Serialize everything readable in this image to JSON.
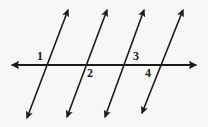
{
  "figure": {
    "background_color": "#f7f7f5",
    "stroke_color": "#1b1b1b",
    "canvas": {
      "width": 208,
      "height": 127
    }
  },
  "transversal": {
    "name": "horizontal-line",
    "type": "double-headed-arrow",
    "x1": 12,
    "y1": 65,
    "x2": 196,
    "y2": 65,
    "stroke_width": 1.8
  },
  "parallel_lines": [
    {
      "id": "line-1",
      "x1": 27,
      "y1": 118,
      "x2": 68,
      "y2": 10,
      "stroke_width": 1.6,
      "arrows": "both"
    },
    {
      "id": "line-2",
      "x1": 67,
      "y1": 117,
      "x2": 107,
      "y2": 10,
      "stroke_width": 1.6,
      "arrows": "both"
    },
    {
      "id": "line-3",
      "x1": 105,
      "y1": 117,
      "x2": 144,
      "y2": 10,
      "stroke_width": 1.6,
      "arrows": "both"
    },
    {
      "id": "line-4",
      "x1": 142,
      "y1": 113,
      "x2": 183,
      "y2": 10,
      "stroke_width": 1.6,
      "arrows": "both"
    }
  ],
  "labels": [
    {
      "id": "angle-label-1",
      "text": "1",
      "x": 37,
      "y": 50,
      "position": "above-left"
    },
    {
      "id": "angle-label-2",
      "text": "2",
      "x": 87,
      "y": 67,
      "position": "below-right"
    },
    {
      "id": "angle-label-3",
      "text": "3",
      "x": 133,
      "y": 50,
      "position": "above-left"
    },
    {
      "id": "angle-label-4",
      "text": "4",
      "x": 145,
      "y": 67,
      "position": "below-right"
    }
  ]
}
